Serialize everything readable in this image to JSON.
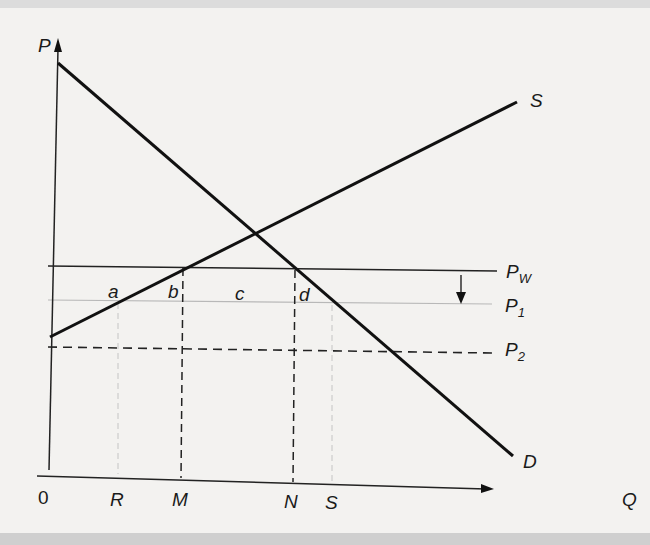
{
  "diagram": {
    "axes": {
      "y_label": "P",
      "x_label": "Q",
      "origin_label": "0"
    },
    "curves": {
      "supply_label": "S",
      "demand_label": "D"
    },
    "price_lines": {
      "pw": {
        "main": "P",
        "sub": "W"
      },
      "p1": {
        "main": "P",
        "sub": "1"
      },
      "p2": {
        "main": "P",
        "sub": "2"
      }
    },
    "areas": {
      "a": "a",
      "b": "b",
      "c": "c",
      "d": "d"
    },
    "quantity_ticks": {
      "R": "R",
      "M": "M",
      "N": "N",
      "S": "S"
    }
  }
}
